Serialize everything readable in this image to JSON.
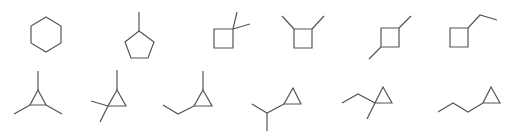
{
  "figure": {
    "title": "C6H12 cycloalkane isomers (skeletal formulas)",
    "stroke_color": "#555555",
    "background": "#ffffff",
    "rows": [
      {
        "name": "top-row",
        "molecules": [
          {
            "id": "m1",
            "name": "cyclohexane",
            "ring": "cyclohexane"
          },
          {
            "id": "m2",
            "name": "methylcyclopentane",
            "ring": "cyclopentane"
          },
          {
            "id": "m3",
            "name": "1,1-dimethylcyclobutane",
            "ring": "cyclobutane"
          },
          {
            "id": "m4",
            "name": "1,2-dimethylcyclobutane",
            "ring": "cyclobutane"
          },
          {
            "id": "m5",
            "name": "1,3-dimethylcyclobutane",
            "ring": "cyclobutane"
          },
          {
            "id": "m6",
            "name": "ethylcyclobutane",
            "ring": "cyclobutane"
          }
        ]
      },
      {
        "name": "bottom-row",
        "molecules": [
          {
            "id": "m7",
            "name": "1,2,3-trimethylcyclopropane",
            "ring": "cyclopropane"
          },
          {
            "id": "m8",
            "name": "1,1,2-trimethylcyclopropane",
            "ring": "cyclopropane"
          },
          {
            "id": "m9",
            "name": "1-ethyl-2-methylcyclopropane",
            "ring": "cyclopropane"
          },
          {
            "id": "m10",
            "name": "isopropylcyclopropane",
            "ring": "cyclopropane"
          },
          {
            "id": "m11",
            "name": "1-ethyl-1-methylcyclopropane",
            "ring": "cyclopropane"
          },
          {
            "id": "m12",
            "name": "propylcyclopropane",
            "ring": "cyclopropane"
          }
        ]
      }
    ]
  }
}
